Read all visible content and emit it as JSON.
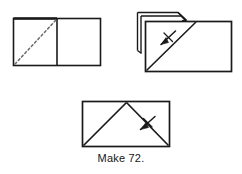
{
  "figure": {
    "caption": "Make 72.",
    "background_color": "#ffffff",
    "line_color": "#1a1a1a",
    "dashed_line_color": "#6b6b6b",
    "steps": [
      {
        "name": "step-1-unfolded-rectangle-with-dashed-diagonal",
        "description": "Rectangle divided into two equal squares by a vertical center line, dashed diagonal fold line across the left square from bottom-left to top-right",
        "shapes": [
          {
            "type": "rectangle",
            "x": 13,
            "y": 18,
            "width": 88,
            "height": 48
          },
          {
            "type": "line",
            "x1": 57,
            "y1": 18,
            "x2": 57,
            "y2": 66,
            "style": "solid"
          },
          {
            "type": "line",
            "x1": 15,
            "y1": 64,
            "x2": 56,
            "y2": 20,
            "style": "dashed"
          }
        ]
      },
      {
        "name": "step-2-layered-rectangle-with-diagonal-and-arrow",
        "description": "Stacked layers of folded paper shown at the upper-left, main rectangle with a solid diagonal from bottom-left to top-right and a fold arrow crossing it",
        "shapes": [
          {
            "type": "layer-outline",
            "offset": 0
          },
          {
            "type": "layer-outline",
            "offset": 4
          },
          {
            "type": "layer-outline",
            "offset": 8
          },
          {
            "type": "rectangle",
            "x": 145,
            "y": 21,
            "width": 87,
            "height": 51
          },
          {
            "type": "line",
            "x1": 146,
            "y1": 71,
            "x2": 196,
            "y2": 21,
            "style": "solid"
          },
          {
            "type": "arrow",
            "from": [
              175,
              31
            ],
            "to": [
              160,
              45
            ],
            "label": "fold-arrow"
          }
        ]
      },
      {
        "name": "step-3-folded-rectangle-with-triangle-and-arrow",
        "description": "Rectangle with a triangle formed by folded edges meeting at a peak on the top edge, fold arrow on the right slope",
        "shapes": [
          {
            "type": "rectangle",
            "x": 82,
            "y": 101,
            "width": 88,
            "height": 46
          },
          {
            "type": "line",
            "x1": 83,
            "y1": 146,
            "x2": 127,
            "y2": 102,
            "style": "solid"
          },
          {
            "type": "line",
            "x1": 127,
            "y1": 102,
            "x2": 169,
            "y2": 146,
            "style": "solid"
          },
          {
            "type": "arrow",
            "from": [
              140,
              130
            ],
            "to": [
              155,
              117
            ],
            "label": "fold-arrow"
          }
        ]
      }
    ]
  }
}
